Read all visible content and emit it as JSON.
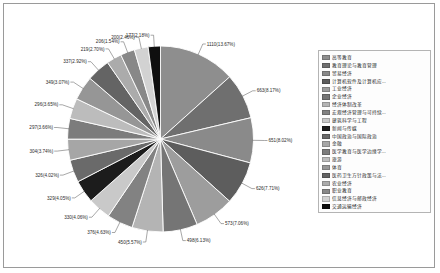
{
  "chart_data": {
    "type": "pie",
    "title": "",
    "subtitle": "",
    "xlabel": "",
    "ylabel": "",
    "legend_position": "right",
    "grid": false,
    "total": 8119,
    "label_format": "count(percent%)",
    "categories": [
      "高等教育",
      "教育理论与教育管理",
      "贸易经济",
      "计算机软件及计算机应...",
      "工业经济",
      "企业经济",
      "经济体制改革",
      "宏观经济管理与可持续...",
      "建筑科学与工程",
      "新闻与传媒",
      "中国政治与国际政治",
      "金融",
      "医学教育与医学边缘学...",
      "旅游",
      "体育",
      "医药卫生方针政策与法...",
      "农业经济",
      "职业教育",
      "信息经济与邮政经济",
      "交通运输经济"
    ],
    "values": [
      1110,
      663,
      651,
      626,
      573,
      498,
      450,
      376,
      330,
      329,
      326,
      304,
      297,
      296,
      349,
      337,
      219,
      206,
      200,
      177
    ],
    "percents": [
      13.67,
      8.17,
      8.02,
      7.71,
      7.06,
      6.13,
      5.57,
      4.63,
      4.06,
      4.05,
      4.02,
      3.74,
      3.66,
      3.65,
      3.07,
      2.92,
      2.7,
      1.54,
      2.46,
      2.18
    ],
    "colors": [
      "#8e8e8e",
      "#6f6f6f",
      "#8a8a8a",
      "#5d5d5d",
      "#9d9d9d",
      "#757575",
      "#b4b4b4",
      "#828282",
      "#c9c9c9",
      "#1c1c1c",
      "#6a6a6a",
      "#a6a6a6",
      "#7c7c7c",
      "#bcbcbc",
      "#969696",
      "#646464",
      "#ababab",
      "#888888",
      "#d2d2d2",
      "#0f0f0f"
    ],
    "data_labels": [
      "1110(13.67%)",
      "663(8.17%)",
      "651(8.02%)",
      "626(7.71%)",
      "573(7.06%)",
      "498(6.13%)",
      "450(5.57%)",
      "376(4.63%)",
      "330(4.06%)",
      "329(4.05%)",
      "326(4.02%)",
      "304(3.74%)",
      "297(3.66%)",
      "296(3.65%)",
      "349(3.07%)",
      "337(2.92%)",
      "219(2.70%)",
      "206(1.54%)",
      "200(2.46%)",
      "177(2.18%)"
    ]
  },
  "legend": {
    "items": [
      {
        "label": "高等教育",
        "color": "#8e8e8e"
      },
      {
        "label": "教育理论与教育管理",
        "color": "#6f6f6f"
      },
      {
        "label": "贸易经济",
        "color": "#8a8a8a"
      },
      {
        "label": "计算机软件及计算机应...",
        "color": "#5d5d5d"
      },
      {
        "label": "工业经济",
        "color": "#9d9d9d"
      },
      {
        "label": "企业经济",
        "color": "#757575"
      },
      {
        "label": "经济体制改革",
        "color": "#b4b4b4"
      },
      {
        "label": "宏观经济管理与可持续...",
        "color": "#828282"
      },
      {
        "label": "建筑科学与工程",
        "color": "#c9c9c9"
      },
      {
        "label": "新闻与传媒",
        "color": "#1c1c1c"
      },
      {
        "label": "中国政治与国际政治",
        "color": "#6a6a6a"
      },
      {
        "label": "金融",
        "color": "#a6a6a6"
      },
      {
        "label": "医学教育与医学边缘学...",
        "color": "#7c7c7c"
      },
      {
        "label": "旅游",
        "color": "#bcbcbc"
      },
      {
        "label": "体育",
        "color": "#969696"
      },
      {
        "label": "医药卫生方针政策与法...",
        "color": "#646464"
      },
      {
        "label": "农业经济",
        "color": "#ababab"
      },
      {
        "label": "职业教育",
        "color": "#888888"
      },
      {
        "label": "信息经济与邮政经济",
        "color": "#d2d2d2"
      },
      {
        "label": "交通运输经济",
        "color": "#0f0f0f"
      }
    ]
  }
}
